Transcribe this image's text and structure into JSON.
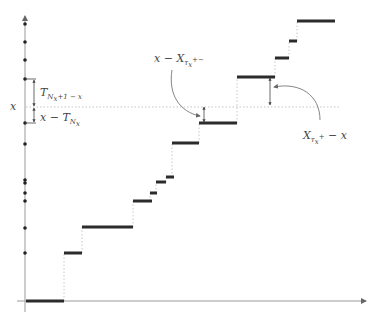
{
  "diagram": {
    "type": "step-function-renewal",
    "colors": {
      "axis": "#9a9a9a",
      "step": "#2b2b2b",
      "guide": "#c4c4c4",
      "text": "#444444"
    },
    "labels": {
      "x_level": "x",
      "upper_gap": {
        "main": "T",
        "sub": "N",
        "subsub": "x",
        "tail": "+1 − x"
      },
      "lower_gap": {
        "main": "x − T",
        "sub": "N",
        "subsub": "x"
      },
      "left_overshoot": {
        "main": "x − X",
        "sub": "τ",
        "subsub": "x",
        "sup": "+",
        "tail": "−"
      },
      "right_overshoot": {
        "main": "X",
        "sub": "τ",
        "subsub": "x",
        "sup": "+",
        "tail": " − x"
      }
    },
    "axis_points_y": [
      24,
      42,
      60,
      79,
      123,
      144,
      180,
      183,
      193,
      201,
      228,
      253
    ],
    "steps": [
      [
        26,
        64,
        301
      ],
      [
        64,
        82,
        253
      ],
      [
        82,
        133,
        227
      ],
      [
        133,
        152,
        201
      ],
      [
        150,
        157,
        193
      ],
      [
        156,
        166,
        182
      ],
      [
        166,
        174,
        177
      ],
      [
        172,
        199,
        143
      ],
      [
        199,
        237,
        123
      ],
      [
        237,
        275,
        77
      ],
      [
        275,
        289,
        58
      ],
      [
        289,
        297,
        41
      ],
      [
        297,
        335,
        21
      ]
    ],
    "x_level_y": 107
  }
}
